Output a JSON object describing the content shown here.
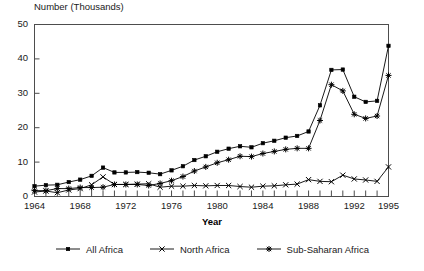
{
  "chart_data": {
    "type": "line",
    "title": "",
    "ylabel": "Number (Thousands)",
    "xlabel": "Year",
    "grid": false,
    "legend_position": "bottom",
    "xlim": [
      1964,
      1995
    ],
    "ylim": [
      0,
      50
    ],
    "ytick_values": [
      0,
      10,
      20,
      30,
      40,
      50
    ],
    "ytick_labels": [
      "0",
      "10",
      "20",
      "30",
      "40",
      "50"
    ],
    "xtick_values": [
      1964,
      1965,
      1966,
      1967,
      1968,
      1969,
      1970,
      1971,
      1972,
      1973,
      1974,
      1975,
      1976,
      1977,
      1978,
      1979,
      1980,
      1981,
      1982,
      1983,
      1984,
      1985,
      1986,
      1987,
      1988,
      1989,
      1990,
      1991,
      1992,
      1993,
      1994,
      1995
    ],
    "xtick_labels_shown": [
      "1964",
      "1968",
      "1972",
      "1976",
      "1980",
      "1984",
      "1988",
      "1992",
      "1995"
    ],
    "x": [
      1964,
      1965,
      1966,
      1967,
      1968,
      1969,
      1970,
      1971,
      1972,
      1973,
      1974,
      1975,
      1976,
      1977,
      1978,
      1979,
      1980,
      1981,
      1982,
      1983,
      1984,
      1985,
      1986,
      1987,
      1988,
      1989,
      1990,
      1991,
      1992,
      1993,
      1994,
      1995
    ],
    "series": [
      {
        "name": "All Africa",
        "marker": "filled-square",
        "color": "#000000",
        "values": [
          3.0,
          3.3,
          3.4,
          4.2,
          4.9,
          6.0,
          8.4,
          7.0,
          7.0,
          7.1,
          6.9,
          6.5,
          7.6,
          8.8,
          10.6,
          11.7,
          13.0,
          13.9,
          14.6,
          14.3,
          15.5,
          16.2,
          17.1,
          17.6,
          18.9,
          26.5,
          36.8,
          36.9,
          29.0,
          27.5,
          27.8,
          43.8
        ]
      },
      {
        "name": "North Africa",
        "marker": "x",
        "color": "#000000",
        "values": [
          1.3,
          1.6,
          1.1,
          1.9,
          2.3,
          3.4,
          5.7,
          3.5,
          3.5,
          3.6,
          3.7,
          2.7,
          3.0,
          3.0,
          3.2,
          3.1,
          3.2,
          3.2,
          2.9,
          2.7,
          3.0,
          3.1,
          3.4,
          3.6,
          4.9,
          4.4,
          4.3,
          6.2,
          5.1,
          4.8,
          4.4,
          8.6
        ]
      },
      {
        "name": "Sub-Saharan Africa",
        "marker": "star",
        "color": "#000000",
        "values": [
          1.7,
          1.7,
          2.3,
          2.3,
          2.6,
          2.6,
          2.7,
          3.5,
          3.5,
          3.5,
          3.2,
          3.8,
          4.6,
          5.8,
          7.4,
          8.6,
          9.8,
          10.7,
          11.7,
          11.6,
          12.5,
          13.1,
          13.7,
          14.0,
          14.0,
          22.1,
          32.5,
          30.7,
          23.9,
          22.7,
          23.4,
          35.2
        ]
      }
    ]
  },
  "legend": {
    "items": [
      {
        "label": "All Africa"
      },
      {
        "label": "North Africa"
      },
      {
        "label": "Sub-Saharan Africa"
      }
    ]
  }
}
